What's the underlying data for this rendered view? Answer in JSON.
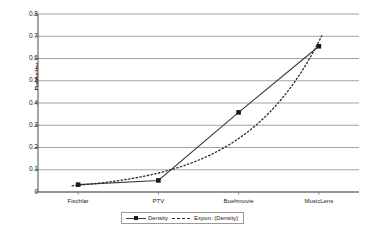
{
  "chart_data": {
    "type": "line",
    "title": "",
    "xlabel": "",
    "ylabel": "Density",
    "categories": [
      "Fischlar",
      "PTV",
      "Boehmovie",
      "MusicLens"
    ],
    "ylim": [
      0,
      0.8
    ],
    "yticks": [
      "0",
      "0.1",
      "0.2",
      "0.3",
      "0.4",
      "0.5",
      "0.6",
      "0.7",
      "0.8"
    ],
    "ytick_values": [
      0,
      0.1,
      0.2,
      0.3,
      0.4,
      0.5,
      0.6,
      0.7,
      0.8
    ],
    "grid": "horizontal",
    "legend_position": "bottom",
    "series": [
      {
        "name": "Density",
        "style": "solid-with-square-markers",
        "color": "#3a3a3a",
        "values": [
          0.033,
          0.052,
          0.358,
          0.655
        ]
      },
      {
        "name": "Expon. (Density)",
        "style": "dotted-trendline",
        "color": "#2a2a2a",
        "values": [
          0.028,
          0.079,
          0.227,
          0.655
        ],
        "extrapolated_end": 0.712
      }
    ]
  },
  "legend": {
    "entries": [
      {
        "label": "Density"
      },
      {
        "label": "Expon. (Density)"
      }
    ]
  },
  "colors": {
    "plot_border": "#5a5a5a",
    "gridline": "#8c8c8c",
    "series_primary": "#3a3a3a",
    "marker": "#1a1a1a",
    "background": "#ffffff",
    "text": "#1a1a1a"
  }
}
